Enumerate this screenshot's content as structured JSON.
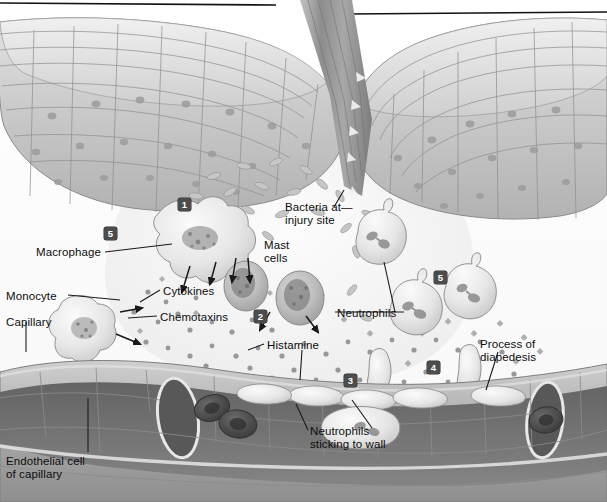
{
  "figure": {
    "style": "grayscale medical illustration",
    "rules": [
      {
        "name": "top-rule-left",
        "x1": 0,
        "y1": 3,
        "x2": 276,
        "y2": 5
      },
      {
        "name": "top-rule-right",
        "x1": 349,
        "y1": 14,
        "x2": 607,
        "y2": 12
      }
    ]
  },
  "palette": {
    "ink": "#0d0d0d",
    "epidermis_fill": "#c9c9c9",
    "epidermis_outline": "#8a8a8a",
    "wound_fluid": "#f2f2f2",
    "capillary_wall": "#b4b4b4",
    "capillary_lumen": "#6f6f6f",
    "rbc": "#4f4f4f",
    "cell_body": "#e8e8e8",
    "cell_outline": "#8f8f8f",
    "marker_bg": "#4c4c4c",
    "marker_text": "#ffffff",
    "splinter": "#9a9a9a"
  },
  "labels": [
    {
      "name": "label-macrophage",
      "text": "Macrophage",
      "x": 36,
      "y": 246,
      "align": "left"
    },
    {
      "name": "label-monocyte",
      "text": "Monocyte",
      "x": 6,
      "y": 290,
      "align": "left"
    },
    {
      "name": "label-capillary",
      "text": "Capillary",
      "x": 6,
      "y": 316,
      "align": "left"
    },
    {
      "name": "label-cytokines",
      "text": "Cytokines",
      "x": 163,
      "y": 285,
      "align": "left"
    },
    {
      "name": "label-chemotaxins",
      "text": "Chemotaxins",
      "x": 160,
      "y": 311,
      "align": "left"
    },
    {
      "name": "label-histamine",
      "text": "Histamine",
      "x": 267,
      "y": 339,
      "align": "left"
    },
    {
      "name": "label-mast-cells",
      "text": "Mast\ncells",
      "x": 264,
      "y": 239,
      "align": "left"
    },
    {
      "name": "label-bacteria",
      "text": "Bacteria at—\ninjury site",
      "x": 285,
      "y": 201,
      "align": "left"
    },
    {
      "name": "label-neutrophils",
      "text": "Neutrophils",
      "x": 337,
      "y": 307,
      "align": "left"
    },
    {
      "name": "label-diapedesis",
      "text": "Process of\ndiapedesis",
      "x": 480,
      "y": 338,
      "align": "left"
    },
    {
      "name": "label-neutrophils-wall",
      "text": "Neutrophils\nsticking to wall",
      "x": 310,
      "y": 425,
      "align": "left"
    },
    {
      "name": "label-endothelial-cell",
      "text": "Endothelial cell\nof capillary",
      "x": 6,
      "y": 455,
      "align": "left"
    }
  ],
  "step_markers": [
    {
      "name": "step-marker-1",
      "number": "1",
      "x": 178,
      "y": 198
    },
    {
      "name": "step-marker-5",
      "number": "5",
      "x": 104,
      "y": 227
    },
    {
      "name": "step-marker-2",
      "number": "2",
      "x": 254,
      "y": 310
    },
    {
      "name": "step-marker-5b",
      "number": "5",
      "x": 434,
      "y": 271
    },
    {
      "name": "step-marker-3",
      "number": "3",
      "x": 344,
      "y": 374
    },
    {
      "name": "step-marker-4",
      "number": "4",
      "x": 427,
      "y": 361
    }
  ],
  "structures": [
    {
      "name": "epidermis-left",
      "description": "stratified squamous epithelium, left of wound"
    },
    {
      "name": "epidermis-right",
      "description": "stratified squamous epithelium, right of wound"
    },
    {
      "name": "splinter",
      "description": "wooden splinter piercing the epidermis"
    },
    {
      "name": "wound-space",
      "description": "pale interstitial fluid at the injury site"
    },
    {
      "name": "bacteria-cluster",
      "description": "rod-shaped bacteria at injury site"
    },
    {
      "name": "macrophage",
      "description": "amoeboid macrophage releasing cytokines"
    },
    {
      "name": "monocyte",
      "description": "monocyte emerging from capillary"
    },
    {
      "name": "mast-cell-1",
      "description": "mast cell releasing histamine"
    },
    {
      "name": "mast-cell-2",
      "description": "mast cell releasing histamine"
    },
    {
      "name": "neutrophil-1",
      "description": "neutrophil migrating toward injury"
    },
    {
      "name": "neutrophil-2",
      "description": "neutrophil migrating toward injury"
    },
    {
      "name": "neutrophil-3",
      "description": "neutrophil migrating toward injury"
    },
    {
      "name": "neutrophil-diapedesis-1",
      "description": "neutrophil squeezing between endothelial cells"
    },
    {
      "name": "neutrophil-diapedesis-2",
      "description": "neutrophil squeezing between endothelial cells"
    },
    {
      "name": "neutrophil-adhering",
      "description": "neutrophil sticking to capillary wall"
    },
    {
      "name": "capillary",
      "description": "capillary cut open showing lumen"
    },
    {
      "name": "red-blood-cells",
      "description": "biconcave erythrocytes within the lumen"
    },
    {
      "name": "signal-molecules",
      "description": "scattered cytokine, chemotaxin and histamine particles"
    }
  ]
}
